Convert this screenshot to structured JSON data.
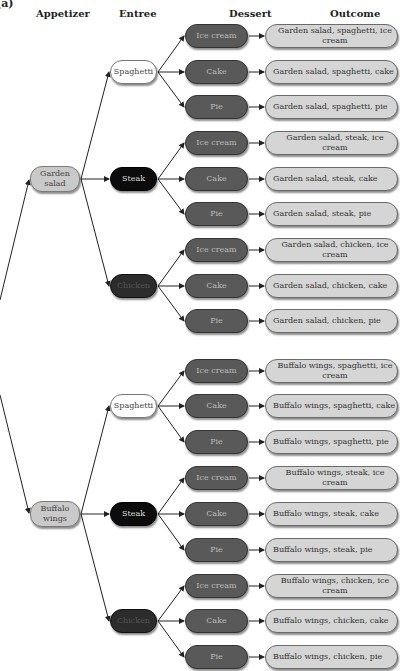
{
  "figure_label": "(a)",
  "headers": {
    "appetizer": "Appetizer",
    "entree": "Entree",
    "dessert": "Dessert",
    "outcome": "Outcome"
  },
  "colors": {
    "appetizer_fill": "#c9c9c9",
    "spaghetti_fill": "#ffffff",
    "steak_fill": "#0c0c0c",
    "chicken_fill": "#2c2c2c",
    "dessert_fill": "#595959",
    "outcome_fill": "#d5d5d5"
  },
  "appetizers": [
    {
      "label": "Garden\nsalad",
      "line1": "Garden",
      "line2": "salad"
    },
    {
      "label": "Buffalo\nwings",
      "line1": "Buffalo",
      "line2": "wings"
    }
  ],
  "entrees": [
    {
      "label": "Spaghetti",
      "parent": "Garden salad"
    },
    {
      "label": "Steak",
      "parent": "Garden salad"
    },
    {
      "label": "Chicken",
      "parent": "Garden salad"
    },
    {
      "label": "Spaghetti",
      "parent": "Buffalo wings"
    },
    {
      "label": "Steak",
      "parent": "Buffalo wings"
    },
    {
      "label": "Chicken",
      "parent": "Buffalo wings"
    }
  ],
  "desserts": [
    {
      "label": "Ice cream"
    },
    {
      "label": "Cake"
    },
    {
      "label": "Pie"
    },
    {
      "label": "Ice cream"
    },
    {
      "label": "Cake"
    },
    {
      "label": "Pie"
    },
    {
      "label": "Ice cream"
    },
    {
      "label": "Cake"
    },
    {
      "label": "Pie"
    },
    {
      "label": "Ice cream"
    },
    {
      "label": "Cake"
    },
    {
      "label": "Pie"
    },
    {
      "label": "Ice cream"
    },
    {
      "label": "Cake"
    },
    {
      "label": "Pie"
    },
    {
      "label": "Ice cream"
    },
    {
      "label": "Cake"
    },
    {
      "label": "Pie"
    }
  ],
  "outcomes": [
    {
      "label": "Garden salad, spaghetti, ice cream"
    },
    {
      "label": "Garden salad, spaghetti, cake"
    },
    {
      "label": "Garden salad, spaghetti, pie"
    },
    {
      "label": "Garden salad, steak, ice cream"
    },
    {
      "label": "Garden salad, steak, cake"
    },
    {
      "label": "Garden salad, steak, pie"
    },
    {
      "label": "Garden salad, chicken, ice cream"
    },
    {
      "label": "Garden salad, chicken, cake"
    },
    {
      "label": "Garden salad, chicken, pie"
    },
    {
      "label": "Buffalo wings, spaghetti, ice cream"
    },
    {
      "label": "Buffalo wings, spaghetti, cake"
    },
    {
      "label": "Buffalo wings, spaghetti, pie"
    },
    {
      "label": "Buffalo wings, steak, ice cream"
    },
    {
      "label": "Buffalo wings, steak, cake"
    },
    {
      "label": "Buffalo wings, steak, pie"
    },
    {
      "label": "Buffalo wings, chicken, ice cream"
    },
    {
      "label": "Buffalo wings, chicken, cake"
    },
    {
      "label": "Buffalo wings, chicken, pie"
    }
  ]
}
